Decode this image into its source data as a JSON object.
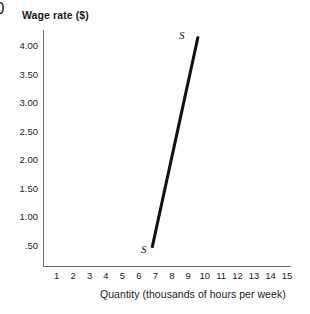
{
  "chart_data": {
    "type": "line",
    "title": "",
    "xlabel": "Quantity (thousands of hours per week)",
    "ylabel": "Wage rate ($)",
    "xlim": [
      0,
      16
    ],
    "ylim": [
      0,
      4.5
    ],
    "grid": false,
    "legend": "none",
    "x_ticks": [
      "0",
      "1",
      "2",
      "3",
      "4",
      "5",
      "6",
      "7",
      "8",
      "9",
      "10",
      "11",
      "12",
      "13",
      "14",
      "15"
    ],
    "x_tick_values": [
      0,
      1,
      2,
      3,
      4,
      5,
      6,
      7,
      8,
      9,
      10,
      11,
      12,
      13,
      14,
      15
    ],
    "y_ticks": [
      "4.00",
      "3.50",
      "3.00",
      "2.50",
      "2.00",
      "1.50",
      "1.00",
      ".50"
    ],
    "y_tick_values": [
      4.0,
      3.5,
      3.0,
      2.5,
      2.0,
      1.5,
      1.0,
      0.5
    ],
    "series": [
      {
        "name": "S",
        "label": "S",
        "color": "#111111",
        "line_width": 3,
        "x": [
          6.8,
          9.6
        ],
        "y": [
          0.45,
          4.15
        ],
        "endpoint_labels": {
          "start": "S",
          "end": "S"
        }
      }
    ],
    "annotations": [
      {
        "text": "S",
        "x": 9.8,
        "y": 4.4,
        "style": "italic"
      },
      {
        "text": "S",
        "x": 7.3,
        "y": 0.38,
        "style": "italic"
      }
    ]
  },
  "axes": {
    "y_title": "Wage rate ($)",
    "x_title": "Quantity (thousands of hours per week)",
    "origin_label": "0",
    "axis_color": "#6e6e6e"
  },
  "curve": {
    "top_label": "S",
    "bottom_label": "S",
    "color": "#111111"
  }
}
